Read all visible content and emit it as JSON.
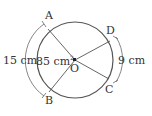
{
  "diagram": {
    "points": {
      "A": "A",
      "B": "B",
      "C": "C",
      "D": "D",
      "O": "O"
    },
    "arc_AB_length": "15 cm",
    "sector_AOB_area": "85 cm",
    "sector_area_exponent": "2",
    "arc_CD_length": "9 cm"
  },
  "colors": {
    "stroke": "#444444",
    "text": "#333333"
  }
}
